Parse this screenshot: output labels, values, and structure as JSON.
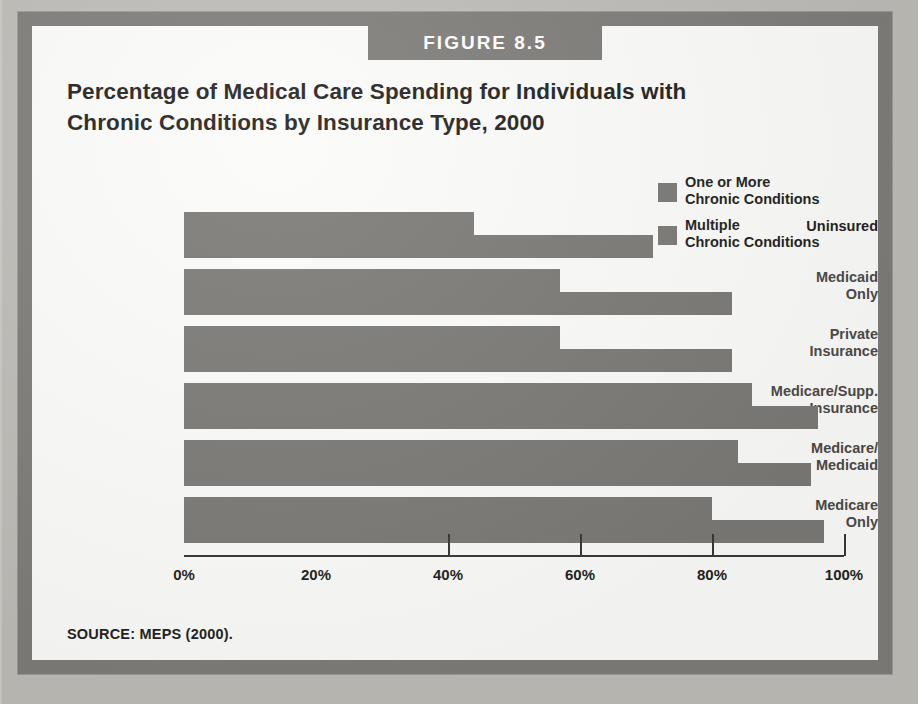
{
  "figure": {
    "banner_label": "FIGURE 8.5",
    "title": "Percentage of Medical Care Spending for Individuals with Chronic Conditions by Insurance Type, 2000",
    "source_note": "SOURCE: MEPS (2000).",
    "frame_color": "#7e7c78",
    "bar_color": "#7a7975",
    "page_background": "#bdbbb6",
    "panel_background": "#fbfbf9"
  },
  "legend": {
    "position": "top-right",
    "items": [
      {
        "label": "One or More\nChronic Conditions",
        "color": "#7a7975"
      },
      {
        "label": "Multiple\nChronic Conditions",
        "color": "#7a7975"
      }
    ]
  },
  "chart_data": {
    "type": "bar",
    "orientation": "horizontal",
    "title": "Percentage of Medical Care Spending for Individuals with Chronic Conditions by Insurance Type, 2000",
    "xlabel": "",
    "ylabel": "",
    "xlim": [
      0,
      100
    ],
    "grid": false,
    "legend_position": "top-right",
    "tick_labels": [
      "0%",
      "20%",
      "40%",
      "60%",
      "80%",
      "100%"
    ],
    "tick_values": [
      0,
      20,
      40,
      60,
      80,
      100
    ],
    "categories": [
      "Uninsured",
      "Medicaid\nOnly",
      "Private\nInsurance",
      "Medicare/Supp.\nInsurance",
      "Medicare/\nMedicaid",
      "Medicare\nOnly"
    ],
    "series": [
      {
        "name": "One or More Chronic Conditions",
        "color": "#7a7975",
        "values": [
          44,
          57,
          57,
          86,
          84,
          80
        ]
      },
      {
        "name": "Multiple Chronic Conditions",
        "color": "#7a7975",
        "values": [
          71,
          83,
          83,
          96,
          95,
          97
        ]
      }
    ]
  }
}
